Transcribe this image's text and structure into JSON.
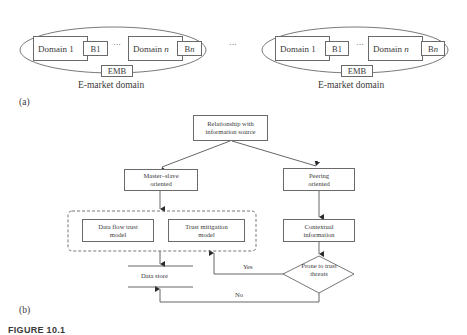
{
  "panel_a": {
    "label": "(a)",
    "separator": "···",
    "domains": [
      {
        "caption": "E-market domain",
        "domain1": "Domain 1",
        "b1": "B1",
        "ellipsis": "···",
        "domain_n_prefix": "Domain ",
        "domain_n_var": "n",
        "bn_prefix": "B",
        "bn_var": "n",
        "emb": "EMB"
      },
      {
        "caption": "E-market domain",
        "domain1": "Domain 1",
        "b1": "B1",
        "ellipsis": "···",
        "domain_n_prefix": "Domain ",
        "domain_n_var": "n",
        "bn_prefix": "B",
        "bn_var": "n",
        "emb": "EMB"
      }
    ]
  },
  "panel_b": {
    "label": "(b)",
    "nodes": {
      "root": "Relationship with information source",
      "master_slave": "Master–slave oriented",
      "peering": "Peering oriented",
      "data_flow": "Data flow trust model",
      "trust_mitigation": "Trust mitigation model",
      "contextual": "Contextual information",
      "decision": "Prone to trust threats",
      "data_store": "Data store"
    },
    "edges": {
      "yes": "Yes",
      "no": "No"
    }
  },
  "caption": "FIGURE 10.1"
}
